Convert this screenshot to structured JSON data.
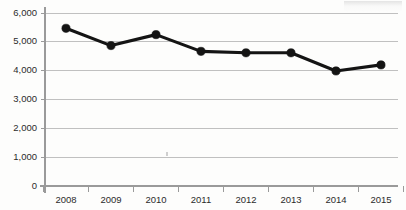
{
  "chart_data": {
    "type": "line",
    "title": "",
    "xlabel": "",
    "ylabel": "",
    "categories": [
      "2008",
      "2009",
      "2010",
      "2011",
      "2012",
      "2013",
      "2014",
      "2015"
    ],
    "values": [
      5470,
      4870,
      5250,
      4670,
      4620,
      4620,
      3990,
      4200
    ],
    "series": [
      {
        "name": "",
        "values": [
          5470,
          4870,
          5250,
          4670,
          4620,
          4620,
          3990,
          4200
        ]
      }
    ],
    "ylim": [
      0,
      6000
    ],
    "ytick_values": [
      0,
      1000,
      2000,
      3000,
      4000,
      5000,
      6000
    ],
    "ytick_labels": [
      "0",
      "1,000",
      "2,000",
      "3,000",
      "4,000",
      "5,000",
      "6,000"
    ],
    "xtick_labels": [
      "2008",
      "2009",
      "2010",
      "2011",
      "2012",
      "2013",
      "2014",
      "2015"
    ],
    "grid": true,
    "grid_axis": "y",
    "legend": false,
    "legend_position": "none",
    "marker": "circle",
    "line_color": "#141414",
    "marker_color": "#141414",
    "grid_color": "#b9b9b9",
    "axis_color": "#9a9a9a",
    "background_color": "#fdfdfc",
    "annotations": []
  }
}
